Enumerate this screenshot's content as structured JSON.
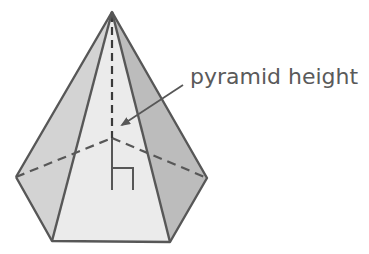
{
  "diagram": {
    "type": "pentagonal pyramid",
    "label": "pyramid height",
    "colors": {
      "front_face": "#ebebeb",
      "left_face": "#d3d3d3",
      "right_face": "#bcbcbc",
      "edge": "#575757",
      "label_text": "#5a5a5a"
    }
  }
}
